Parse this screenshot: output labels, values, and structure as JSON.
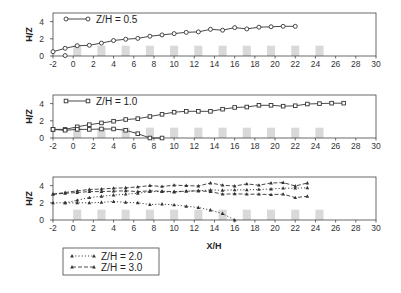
{
  "chart_data": [
    {
      "type": "line",
      "title": "",
      "xlabel": "",
      "ylabel": "Z/H",
      "xlim": [
        -2,
        30
      ],
      "ylim": [
        0,
        5
      ],
      "xticks": [
        -2,
        0,
        2,
        4,
        6,
        8,
        10,
        12,
        14,
        16,
        18,
        20,
        22,
        24,
        26,
        28,
        30
      ],
      "yticks": [
        0,
        2,
        4
      ],
      "legend": {
        "placement": "top-left",
        "entries": [
          {
            "label": "Z/H = 0.5",
            "marker": "circle",
            "linestyle": "solid"
          }
        ]
      },
      "series": [
        {
          "name": "Z/H = 0.5",
          "marker": "circle",
          "linestyle": "solid",
          "x": [
            -2,
            -0.8,
            0.4,
            1.6,
            2.8,
            4.0,
            5.2,
            6.4,
            7.6,
            8.8,
            10.0,
            11.2,
            12.4,
            13.6,
            14.8,
            16.0,
            17.2,
            18.4,
            19.6,
            20.8,
            22.0
          ],
          "y": [
            0.5,
            0.9,
            1.2,
            1.25,
            1.5,
            1.8,
            1.95,
            2.05,
            2.3,
            2.45,
            2.6,
            2.75,
            2.8,
            3.1,
            3.0,
            3.3,
            3.15,
            3.35,
            3.4,
            3.45,
            3.45
          ]
        },
        {
          "name": "Z/H = 0.5 (near-wall)",
          "marker": "circle",
          "linestyle": "solid",
          "x": [
            -0.8
          ],
          "y": [
            0.05
          ]
        }
      ],
      "shaded_blocks": {
        "x_centers": [
          0.4,
          2.8,
          5.2,
          7.6,
          10.0,
          12.4,
          14.8,
          17.2,
          19.6,
          22.0,
          24.4
        ],
        "width": 0.8,
        "height": 1.2
      }
    },
    {
      "type": "line",
      "title": "",
      "xlabel": "",
      "ylabel": "Z/H",
      "xlim": [
        -2,
        30
      ],
      "ylim": [
        0,
        5
      ],
      "xticks": [
        -2,
        0,
        2,
        4,
        6,
        8,
        10,
        12,
        14,
        16,
        18,
        20,
        22,
        24,
        26,
        28,
        30
      ],
      "yticks": [
        0,
        2,
        4
      ],
      "legend": {
        "placement": "top-left",
        "entries": [
          {
            "label": "Z/H = 1.0",
            "marker": "square",
            "linestyle": "solid"
          }
        ]
      },
      "series": [
        {
          "name": "Z/H = 1.0 upper",
          "marker": "square",
          "linestyle": "solid",
          "x": [
            -2,
            -0.8,
            0.4,
            1.6,
            2.8,
            4.0,
            5.2,
            6.4,
            7.6,
            8.8,
            10.0,
            11.2,
            12.4,
            13.6,
            14.8,
            16.0,
            17.2,
            18.4,
            19.6,
            20.8,
            22.0,
            23.2,
            24.4,
            25.6,
            26.8
          ],
          "y": [
            1.0,
            1.0,
            1.3,
            1.55,
            1.75,
            1.95,
            2.15,
            2.25,
            2.5,
            2.75,
            3.0,
            3.1,
            3.1,
            3.1,
            3.35,
            3.55,
            3.6,
            3.8,
            3.8,
            3.7,
            3.75,
            3.95,
            4.0,
            4.05,
            4.05
          ]
        },
        {
          "name": "Z/H = 1.0 lower",
          "marker": "square",
          "linestyle": "solid",
          "x": [
            -2,
            -0.8,
            0.4,
            1.6,
            2.8,
            4.0,
            5.2,
            6.4,
            7.6,
            8.8
          ],
          "y": [
            1.0,
            0.9,
            1.0,
            1.0,
            1.05,
            1.05,
            0.9,
            0.5,
            0.0,
            0.0
          ]
        }
      ],
      "shaded_blocks": {
        "x_centers": [
          0.4,
          2.8,
          5.2,
          7.6,
          10.0,
          12.4,
          14.8,
          17.2,
          19.6,
          22.0,
          24.4
        ],
        "width": 0.8,
        "height": 1.2
      }
    },
    {
      "type": "line",
      "title": "",
      "xlabel": "X/H",
      "ylabel": "Z/H",
      "xlim": [
        -2,
        30
      ],
      "ylim": [
        0,
        5
      ],
      "xticks": [
        -2,
        0,
        2,
        4,
        6,
        8,
        10,
        12,
        14,
        16,
        18,
        20,
        22,
        24,
        26,
        28,
        30
      ],
      "yticks": [
        0,
        2,
        4
      ],
      "legend": {
        "placement": "bottom-left",
        "entries": [
          {
            "label": "Z/H = 2.0",
            "marker": "triangle",
            "linestyle": "dotted"
          },
          {
            "label": "Z/H = 3.0",
            "marker": "triangle",
            "linestyle": "dashed"
          }
        ]
      },
      "series": [
        {
          "name": "Z/H = 2.0 lower",
          "marker": "triangle",
          "linestyle": "dotted",
          "x": [
            -2,
            -0.8,
            0.4,
            1.6,
            2.8,
            4.0,
            5.2,
            6.4,
            7.6,
            8.8,
            10.0,
            11.2,
            12.4,
            13.6,
            14.8,
            16.0
          ],
          "y": [
            2.0,
            2.0,
            2.0,
            2.0,
            2.05,
            2.15,
            2.05,
            2.0,
            1.8,
            1.85,
            1.75,
            1.6,
            1.45,
            1.15,
            0.75,
            0.0
          ]
        },
        {
          "name": "Z/H = 2.0 upper",
          "marker": "triangle",
          "linestyle": "dotted",
          "x": [
            -0.8,
            0.4,
            1.6,
            2.8,
            4.0,
            5.2,
            6.4,
            7.6,
            8.8,
            10.0,
            11.2,
            12.4,
            13.6,
            14.8,
            16.0,
            17.2,
            18.4,
            19.6,
            20.8,
            22.0,
            23.2
          ],
          "y": [
            2.0,
            2.3,
            2.6,
            2.75,
            2.9,
            3.0,
            3.1,
            3.3,
            3.3,
            3.25,
            3.35,
            3.4,
            3.5,
            3.45,
            3.5,
            3.5,
            3.55,
            3.6,
            3.7,
            3.7,
            3.75
          ]
        },
        {
          "name": "Z/H = 3.0 upper",
          "marker": "triangle",
          "linestyle": "dashed",
          "x": [
            -2,
            -0.8,
            0.4,
            1.6,
            2.8,
            4.0,
            5.2,
            6.4,
            7.6,
            8.8,
            10.0,
            11.2,
            12.4,
            13.6,
            14.8,
            16.0,
            17.2,
            18.4,
            19.6,
            20.8,
            22.0,
            23.2
          ],
          "y": [
            3.0,
            3.2,
            3.4,
            3.55,
            3.6,
            3.7,
            3.75,
            3.85,
            4.0,
            3.9,
            4.05,
            4.0,
            3.95,
            4.3,
            4.05,
            3.95,
            4.2,
            4.05,
            4.3,
            4.35,
            3.95,
            4.3
          ]
        },
        {
          "name": "Z/H = 3.0 lower",
          "marker": "triangle",
          "linestyle": "dashed",
          "x": [
            -2,
            -0.8,
            0.4,
            1.6,
            2.8,
            4.0,
            5.2,
            6.4,
            7.6,
            8.8,
            10.0,
            11.2,
            12.4,
            13.6,
            14.8,
            16.0,
            17.2,
            18.4,
            19.6,
            20.8,
            22.0,
            23.2
          ],
          "y": [
            3.0,
            3.1,
            3.2,
            3.3,
            3.3,
            3.35,
            3.4,
            3.3,
            3.4,
            3.35,
            3.3,
            3.35,
            3.4,
            3.3,
            3.0,
            3.05,
            3.0,
            3.0,
            2.95,
            3.0,
            2.6,
            2.75
          ]
        }
      ],
      "shaded_blocks": {
        "x_centers": [
          0.4,
          2.8,
          5.2,
          7.6,
          10.0,
          12.4,
          14.8,
          17.2,
          19.6,
          22.0,
          24.4
        ],
        "width": 0.8,
        "height": 1.2
      }
    }
  ],
  "colors": {
    "line": "#333333",
    "frame": "#444444",
    "block": "#d9d9d9"
  }
}
